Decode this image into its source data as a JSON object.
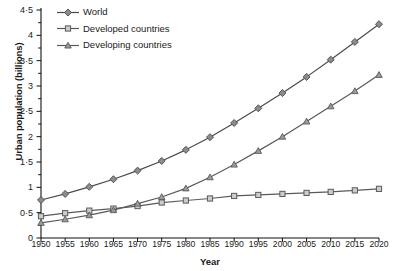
{
  "chart_data": {
    "type": "line",
    "title": "",
    "xlabel": "Year",
    "ylabel": "Urban population (billions)",
    "xlim": [
      1950,
      2020
    ],
    "ylim": [
      0,
      4.5
    ],
    "ytick_step": 0.5,
    "yminor_step": 0.25,
    "grid": false,
    "legend_position": "top-left",
    "decimal_separator": "·",
    "x": [
      1950,
      1955,
      1960,
      1965,
      1970,
      1975,
      1980,
      1985,
      1990,
      1995,
      2000,
      2005,
      2010,
      2015,
      2020
    ],
    "xtick_labels": [
      "1950",
      "1955",
      "1960",
      "1965",
      "1970",
      "1975",
      "1980",
      "1985",
      "1990",
      "1995",
      "2000",
      "2005",
      "2010",
      "2015",
      "2020"
    ],
    "ytick_labels": [
      "0",
      "0·5",
      "1",
      "1·5",
      "2",
      "2·5",
      "3",
      "3·5",
      "4",
      "4·5"
    ],
    "ytick_values": [
      0,
      0.5,
      1,
      1.5,
      2,
      2.5,
      3,
      3.5,
      4,
      4.5
    ],
    "series": [
      {
        "name": "World",
        "marker": "diamond",
        "color": "#4a4a4a",
        "marker_fill": "#8c8c8c",
        "values": [
          0.75,
          0.87,
          1.01,
          1.16,
          1.33,
          1.52,
          1.74,
          1.99,
          2.27,
          2.56,
          2.86,
          3.18,
          3.52,
          3.87,
          4.22
        ]
      },
      {
        "name": "Developed countries",
        "marker": "square",
        "color": "#5a5a5a",
        "marker_fill": "#cccccc",
        "values": [
          0.43,
          0.49,
          0.54,
          0.58,
          0.63,
          0.7,
          0.74,
          0.78,
          0.83,
          0.85,
          0.87,
          0.89,
          0.91,
          0.94,
          0.97
        ]
      },
      {
        "name": "Developing countries",
        "marker": "triangle",
        "color": "#5a5a5a",
        "marker_fill": "#9a9a9a",
        "values": [
          0.3,
          0.37,
          0.45,
          0.55,
          0.68,
          0.81,
          0.98,
          1.2,
          1.45,
          1.72,
          2.0,
          2.3,
          2.6,
          2.9,
          3.22
        ]
      }
    ]
  },
  "axis": {
    "x_title": "Year",
    "y_title": "Urban population (billions)"
  },
  "legend": {
    "items": [
      {
        "label": "World"
      },
      {
        "label": "Developed countries"
      },
      {
        "label": "Developing countries"
      }
    ]
  }
}
